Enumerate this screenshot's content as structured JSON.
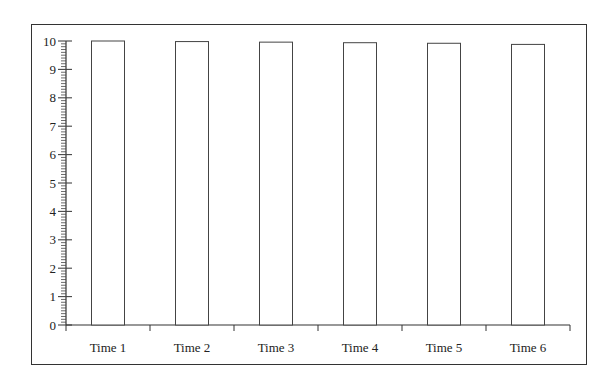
{
  "chart_data": {
    "type": "bar",
    "title": "",
    "xlabel": "",
    "ylabel": "",
    "categories": [
      "Time 1",
      "Time 2",
      "Time 3",
      "Time 4",
      "Time 5",
      "Time 6"
    ],
    "values": [
      10,
      9.98,
      9.96,
      9.94,
      9.92,
      9.88
    ],
    "ylim": [
      0,
      10
    ],
    "yticks": [
      0,
      1,
      2,
      3,
      4,
      5,
      6,
      7,
      8,
      9,
      10
    ],
    "minor_ticks_per_unit": 10,
    "grid": false,
    "legend": null,
    "bar_fill": "#ffffff",
    "bar_stroke": "#444444",
    "frame": true
  }
}
